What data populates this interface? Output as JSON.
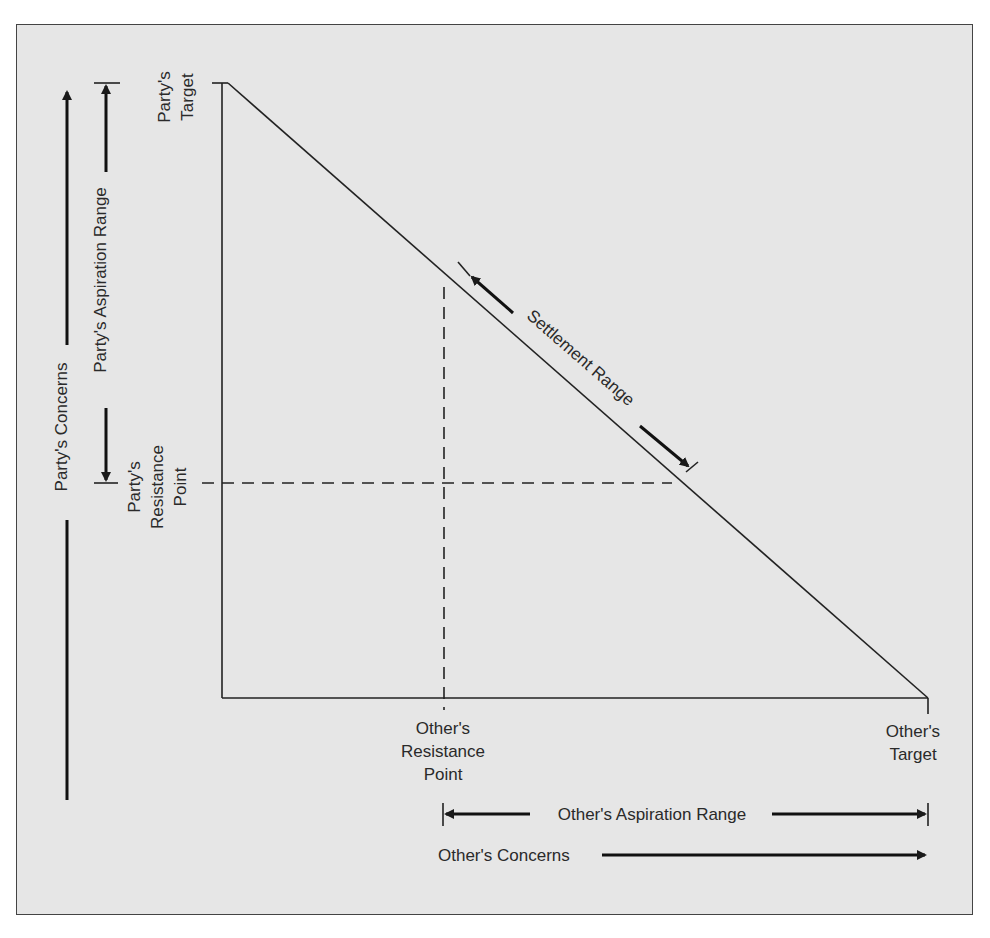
{
  "diagram": {
    "type": "negotiation-bargaining-range",
    "colors": {
      "background": "#e6e6e6",
      "line": "#1a1a1a",
      "text": "#2a2a2a"
    },
    "labels": {
      "party_target_1": "Party's",
      "party_target_2": "Target",
      "party_resistance_1": "Party's",
      "party_resistance_2": "Resistance",
      "party_resistance_3": "Point",
      "party_aspiration_range": "Party's Aspiration Range",
      "party_concerns": "Party's Concerns",
      "settlement_range": "Settlement Range",
      "other_resistance_1": "Other's",
      "other_resistance_2": "Resistance",
      "other_resistance_3": "Point",
      "other_target_1": "Other's",
      "other_target_2": "Target",
      "other_aspiration_range": "Other's Aspiration Range",
      "other_concerns": "Other's Concerns"
    }
  }
}
